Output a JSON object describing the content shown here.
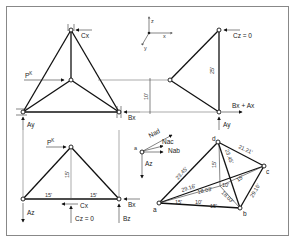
{
  "figure": {
    "top_left": {
      "title": "front view truss",
      "labels": {
        "cx": "Cx",
        "load": "P",
        "load_sup": "K",
        "ay": "Ay",
        "bx": "Bx"
      }
    },
    "axes": {
      "z": "z",
      "x": "x",
      "y": "y"
    },
    "top_right": {
      "labels": {
        "cz": "Cz = 0",
        "bx_ax": "Bx + Ax",
        "ay": "Ay"
      },
      "dims": {
        "height": "25'",
        "offset": "10'"
      }
    },
    "bottom_left": {
      "labels": {
        "load": "P",
        "load_sup": "K",
        "az": "Az",
        "cx": "Cx",
        "cz": "Cz = 0",
        "bx": "Bx",
        "bz": "Bz"
      },
      "dims": {
        "left": "15'",
        "right": "15'",
        "height": "15'"
      }
    },
    "free_body": {
      "labels": {
        "node": "a",
        "nad": "Nad",
        "nac": "Nac",
        "nab": "Nab",
        "az": "Az"
      }
    },
    "iso_view": {
      "nodes": {
        "a": "a",
        "b": "b",
        "c": "c",
        "d": "d"
      },
      "dims": {
        "ad": "23.45'",
        "dc": "21.21'",
        "db": "23.45'",
        "ac": "29.16'",
        "bc": "29.16'",
        "ae": "18.03'",
        "eb": "18.03'",
        "dz": "15'",
        "ec": "15'",
        "a_x": "15'",
        "mid": "10'",
        "ab": "15'",
        "e": "10'"
      }
    }
  }
}
